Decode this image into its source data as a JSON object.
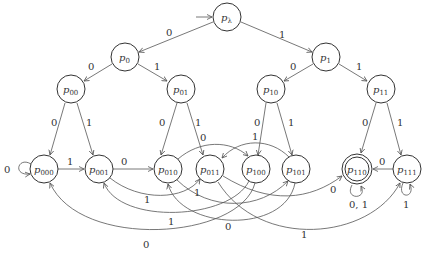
{
  "diagram": {
    "type": "finite-automaton",
    "nodes": [
      {
        "id": "pλ",
        "base": "p",
        "sub": "λ",
        "x": 227,
        "y": 17,
        "initial": true,
        "accepting": false
      },
      {
        "id": "p0",
        "base": "p",
        "sub": "0",
        "x": 125,
        "y": 57
      },
      {
        "id": "p1",
        "base": "p",
        "sub": "1",
        "x": 326,
        "y": 57
      },
      {
        "id": "p00",
        "base": "p",
        "sub": "00",
        "x": 71,
        "y": 89
      },
      {
        "id": "p01",
        "base": "p",
        "sub": "01",
        "x": 181,
        "y": 89
      },
      {
        "id": "p10",
        "base": "p",
        "sub": "10",
        "x": 271,
        "y": 89
      },
      {
        "id": "p11",
        "base": "p",
        "sub": "11",
        "x": 381,
        "y": 89
      },
      {
        "id": "p000",
        "base": "p",
        "sub": "000",
        "x": 44,
        "y": 169
      },
      {
        "id": "p001",
        "base": "p",
        "sub": "001",
        "x": 99,
        "y": 169
      },
      {
        "id": "p010",
        "base": "p",
        "sub": "010",
        "x": 168,
        "y": 169
      },
      {
        "id": "p011",
        "base": "p",
        "sub": "011",
        "x": 210,
        "y": 169
      },
      {
        "id": "p100",
        "base": "p",
        "sub": "100",
        "x": 256,
        "y": 169
      },
      {
        "id": "p101",
        "base": "p",
        "sub": "101",
        "x": 296,
        "y": 169
      },
      {
        "id": "p110",
        "base": "p",
        "sub": "110",
        "x": 357,
        "y": 169,
        "accepting": true
      },
      {
        "id": "p111",
        "base": "p",
        "sub": "111",
        "x": 407,
        "y": 169
      }
    ],
    "edges": [
      {
        "from": "pλ",
        "to": "p0",
        "label": "0"
      },
      {
        "from": "pλ",
        "to": "p1",
        "label": "1"
      },
      {
        "from": "p0",
        "to": "p00",
        "label": "0"
      },
      {
        "from": "p0",
        "to": "p01",
        "label": "1"
      },
      {
        "from": "p1",
        "to": "p10",
        "label": "0"
      },
      {
        "from": "p1",
        "to": "p11",
        "label": "1"
      },
      {
        "from": "p00",
        "to": "p000",
        "label": "0"
      },
      {
        "from": "p00",
        "to": "p001",
        "label": "1"
      },
      {
        "from": "p01",
        "to": "p010",
        "label": "0"
      },
      {
        "from": "p01",
        "to": "p011",
        "label": "1"
      },
      {
        "from": "p10",
        "to": "p100",
        "label": "0"
      },
      {
        "from": "p10",
        "to": "p101",
        "label": "1"
      },
      {
        "from": "p11",
        "to": "p110",
        "label": "0"
      },
      {
        "from": "p11",
        "to": "p111",
        "label": "1"
      },
      {
        "from": "p000",
        "to": "p000",
        "label": "0"
      },
      {
        "from": "p000",
        "to": "p001",
        "label": "1"
      },
      {
        "from": "p001",
        "to": "p010",
        "label": "0"
      },
      {
        "from": "p001",
        "to": "p011",
        "label": "1"
      },
      {
        "from": "p010",
        "to": "p100",
        "label": "0"
      },
      {
        "from": "p010",
        "to": "p101",
        "label": "1"
      },
      {
        "from": "p011",
        "to": "p110",
        "label": "0"
      },
      {
        "from": "p011",
        "to": "p111",
        "label": "1"
      },
      {
        "from": "p100",
        "to": "p000",
        "label": "0"
      },
      {
        "from": "p100",
        "to": "p001",
        "label": "1"
      },
      {
        "from": "p101",
        "to": "p010",
        "label": "0"
      },
      {
        "from": "p101",
        "to": "p011",
        "label": "1"
      },
      {
        "from": "p110",
        "to": "p110",
        "label": "0,1"
      },
      {
        "from": "p111",
        "to": "p110",
        "label": "0"
      },
      {
        "from": "p111",
        "to": "p111",
        "label": "1"
      }
    ]
  },
  "labels": {
    "e_l_0": "0",
    "e_l_1": "1",
    "e_0_00": "0",
    "e_0_01": "1",
    "e_1_10": "0",
    "e_1_11": "1",
    "e_00_000": "0",
    "e_00_001": "1",
    "e_01_010": "0",
    "e_01_011": "1",
    "e_10_100": "0",
    "e_10_101": "1",
    "e_11_110": "0",
    "e_11_111": "1",
    "e_000_000": "0",
    "e_000_001": "1",
    "e_001_010": "0",
    "e_001_011": "1",
    "e_010_100": "0",
    "e_010_101": "1",
    "e_011_110": "0",
    "e_011_111": "1",
    "e_100_000": "0",
    "e_100_001": "1",
    "e_101_010": "0",
    "e_101_011": "1",
    "e_110_110": "0, 1",
    "e_111_110": "0",
    "e_111_111": "1"
  },
  "nodes": {
    "pl": {
      "base": "p",
      "sub": "λ"
    },
    "p0": {
      "base": "p",
      "sub": "0"
    },
    "p1": {
      "base": "p",
      "sub": "1"
    },
    "p00": {
      "base": "p",
      "sub": "00"
    },
    "p01": {
      "base": "p",
      "sub": "01"
    },
    "p10": {
      "base": "p",
      "sub": "10"
    },
    "p11": {
      "base": "p",
      "sub": "11"
    },
    "p000": {
      "base": "p",
      "sub": "000"
    },
    "p001": {
      "base": "p",
      "sub": "001"
    },
    "p010": {
      "base": "p",
      "sub": "010"
    },
    "p011": {
      "base": "p",
      "sub": "011"
    },
    "p100": {
      "base": "p",
      "sub": "100"
    },
    "p101": {
      "base": "p",
      "sub": "101"
    },
    "p110": {
      "base": "p",
      "sub": "110"
    },
    "p111": {
      "base": "p",
      "sub": "111"
    }
  }
}
